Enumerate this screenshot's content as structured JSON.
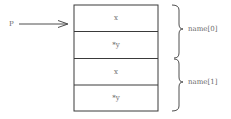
{
  "pointer": {
    "label": "P"
  },
  "cells": [
    {
      "text": "x"
    },
    {
      "text": "*y"
    },
    {
      "text": "x"
    },
    {
      "text": "*y"
    }
  ],
  "groups": [
    {
      "label": "name[0]"
    },
    {
      "label": "name[1]"
    }
  ],
  "colors": {
    "line": "#3a3a3a",
    "text": "#6a6a6a"
  }
}
